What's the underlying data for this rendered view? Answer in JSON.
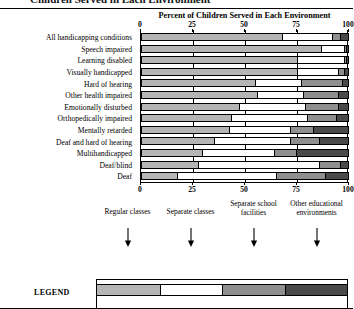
{
  "page": {
    "cropped_header_text": "Children Served in Each Environment"
  },
  "chart_data": {
    "type": "bar",
    "orientation": "horizontal",
    "stacked": true,
    "title": "Percent of Children Served in Each Environment",
    "xlabel": "",
    "ylabel": "",
    "xlim": [
      0,
      100
    ],
    "xticks": [
      0,
      25,
      50,
      75,
      100
    ],
    "xticklabels": [
      "0",
      "25",
      "50",
      "75",
      "100"
    ],
    "grid": true,
    "legend_position": "bottom",
    "legend_title": "LEGEND",
    "series": [
      {
        "name": "Regular classes",
        "color": "#b5b5b5",
        "values": [
          68,
          87,
          75,
          75,
          55,
          56,
          47,
          43,
          42,
          35,
          29,
          27,
          17
        ]
      },
      {
        "name": "Separate classes",
        "color": "#ffffff",
        "values": [
          24,
          11,
          23,
          20,
          22,
          22,
          32,
          37,
          30,
          37,
          35,
          59,
          48
        ]
      },
      {
        "name": "Separate school facilities",
        "color": "#8f8f8f",
        "values": [
          4,
          1,
          1,
          3,
          20,
          17,
          16,
          14,
          11,
          14,
          11,
          10,
          24
        ]
      },
      {
        "name": "Other educational environments",
        "color": "#4a4a4a",
        "values": [
          4,
          1,
          1,
          2,
          3,
          5,
          5,
          6,
          17,
          14,
          25,
          4,
          11
        ]
      }
    ],
    "categories": [
      "All handicapping conditions",
      "Speech impaired",
      "Learning disabled",
      "Visually handicapped",
      "Hard of hearing",
      "Other health impaired",
      "Emotionally disturbed",
      "Orthopedically impaired",
      "Mentally retarded",
      "Deaf and hard of hearing",
      "Multihandicapped",
      "Deaf/blind",
      "Deaf"
    ]
  }
}
